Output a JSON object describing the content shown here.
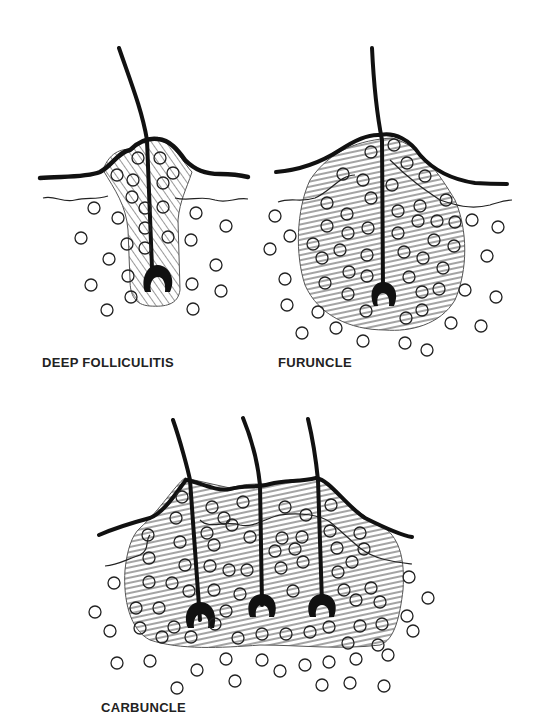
{
  "figure": {
    "panels": [
      {
        "id": "deep-folliculitis",
        "label": "DEEP FOLLICULITIS",
        "hairs": 1
      },
      {
        "id": "furuncle",
        "label": "FURUNCLE",
        "hairs": 1
      },
      {
        "id": "carbuncle",
        "label": "CARBUNCLE",
        "hairs": 3
      }
    ],
    "colors": {
      "ink": "#111111",
      "background": "#ffffff",
      "hatch": "#333333"
    }
  }
}
